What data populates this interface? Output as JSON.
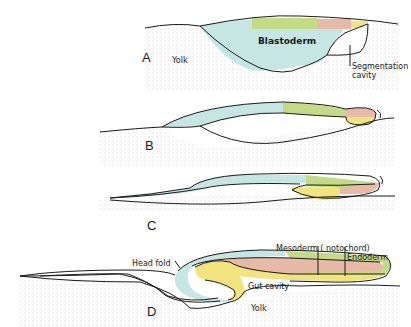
{
  "figure": {
    "panels": [
      {
        "id": "A",
        "labels": {
          "blastoderm": "Blastoderm",
          "yolk": "Yolk",
          "segmentation_cavity_1": "Segmentation",
          "segmentation_cavity_2": "cavity"
        }
      },
      {
        "id": "B",
        "labels": {}
      },
      {
        "id": "C",
        "labels": {}
      },
      {
        "id": "D",
        "labels": {
          "head_fold": "Head fold",
          "mesoderm": "Mesoderm ( notochord)",
          "endoderm": "Endoderm",
          "gut_cavity": "Gut cavity",
          "yolk": "Yolk"
        }
      }
    ],
    "colors": {
      "ectoderm_blue": "#c6e6e4",
      "mesoderm_green": "#c2db84",
      "notochord_pink": "#e8b8a8",
      "endoderm_yellow": "#f1e47c",
      "yolk_stipple": "#d8d8d8",
      "outline": "#1a1a1a"
    }
  }
}
